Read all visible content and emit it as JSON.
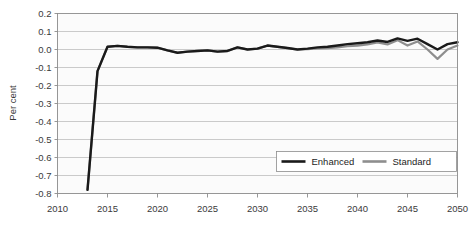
{
  "chart_data": {
    "type": "line",
    "title": "",
    "xlabel": "",
    "ylabel": "Per cent",
    "xlim": [
      2010,
      2050
    ],
    "ylim": [
      -0.8,
      0.2
    ],
    "xticks": [
      2010,
      2015,
      2020,
      2025,
      2030,
      2035,
      2040,
      2045,
      2050
    ],
    "yticks": [
      0.2,
      0.1,
      0.0,
      -0.1,
      -0.2,
      -0.3,
      -0.4,
      -0.5,
      -0.6,
      -0.7,
      -0.8
    ],
    "ytick_labels": [
      "0.2",
      "0.1",
      "0.0",
      "-0.1",
      "-0.2",
      "-0.3",
      "-0.4",
      "-0.5",
      "-0.6",
      "-0.7",
      "-0.8"
    ],
    "xtick_labels": [
      "2010",
      "2015",
      "2020",
      "2025",
      "2030",
      "2035",
      "2040",
      "2045",
      "2050"
    ],
    "grid": true,
    "legend_position": "bottom-right",
    "series": [
      {
        "name": "Enhanced",
        "color": "#1a1a1a",
        "x": [
          2013,
          2014,
          2015,
          2016,
          2017,
          2018,
          2019,
          2020,
          2021,
          2022,
          2023,
          2024,
          2025,
          2026,
          2027,
          2028,
          2029,
          2030,
          2031,
          2032,
          2033,
          2034,
          2035,
          2036,
          2037,
          2038,
          2039,
          2040,
          2041,
          2042,
          2043,
          2044,
          2045,
          2046,
          2047,
          2048,
          2049,
          2050
        ],
        "values": [
          -0.78,
          -0.12,
          0.015,
          0.02,
          0.015,
          0.012,
          0.012,
          0.01,
          -0.005,
          -0.018,
          -0.012,
          -0.008,
          -0.005,
          -0.012,
          -0.008,
          0.012,
          0.0,
          0.005,
          0.022,
          0.015,
          0.008,
          0.0,
          0.005,
          0.012,
          0.015,
          0.022,
          0.03,
          0.035,
          0.04,
          0.05,
          0.042,
          0.062,
          0.048,
          0.06,
          0.03,
          0.0,
          0.03,
          0.04
        ]
      },
      {
        "name": "Standard",
        "color": "#8e8e8e",
        "x": [
          2013,
          2014,
          2015,
          2016,
          2017,
          2018,
          2019,
          2020,
          2021,
          2022,
          2023,
          2024,
          2025,
          2026,
          2027,
          2028,
          2029,
          2030,
          2031,
          2032,
          2033,
          2034,
          2035,
          2036,
          2037,
          2038,
          2039,
          2040,
          2041,
          2042,
          2043,
          2044,
          2045,
          2046,
          2047,
          2048,
          2049,
          2050
        ],
        "values": [
          -0.78,
          -0.12,
          0.015,
          0.02,
          0.015,
          0.012,
          0.012,
          0.01,
          -0.005,
          -0.018,
          -0.012,
          -0.008,
          -0.005,
          -0.012,
          -0.008,
          0.012,
          0.0,
          0.005,
          0.022,
          0.015,
          0.008,
          0.0,
          0.002,
          0.006,
          0.008,
          0.012,
          0.018,
          0.022,
          0.028,
          0.04,
          0.028,
          0.052,
          0.022,
          0.045,
          0.0,
          -0.052,
          0.0,
          0.022
        ]
      }
    ]
  },
  "legend": {
    "entries": [
      {
        "label": "Enhanced"
      },
      {
        "label": "Standard"
      }
    ]
  }
}
